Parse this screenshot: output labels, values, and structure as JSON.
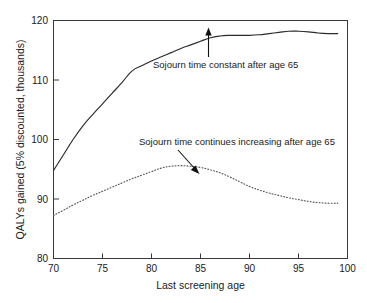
{
  "figure": {
    "background_color": "#ffffff",
    "ink_color": "#2b2b2b"
  },
  "chart_data": {
    "type": "line",
    "title": "",
    "xlabel": "Last screening age",
    "ylabel": "QALYs gained (5% discounted, thousands)",
    "xlim": [
      70,
      100
    ],
    "ylim": [
      80,
      120
    ],
    "xticks": [
      70,
      75,
      80,
      85,
      90,
      95,
      100
    ],
    "yticks": [
      80,
      90,
      100,
      110,
      120
    ],
    "xtick_labels": [
      "70",
      "75",
      "80",
      "85",
      "90",
      "95",
      "100"
    ],
    "ytick_labels": [
      "80",
      "90",
      "100",
      "110",
      "120"
    ],
    "grid": false,
    "legend": "none",
    "legend_position": "inline-annotations",
    "series": [
      {
        "name": "Sojourn time constant after age 65",
        "style": "solid",
        "color": "#2b2b2b",
        "x": [
          70,
          71,
          72,
          73,
          74,
          75,
          76,
          77,
          78,
          79,
          80,
          81,
          82,
          83,
          84,
          85,
          86,
          87,
          88,
          89,
          90,
          91,
          92,
          93,
          94,
          95,
          96,
          97,
          98,
          99
        ],
        "y": [
          94.8,
          97.4,
          100.0,
          102.3,
          104.2,
          106.0,
          107.8,
          109.6,
          111.5,
          112.4,
          113.2,
          113.9,
          114.6,
          115.3,
          115.9,
          116.5,
          117.1,
          117.4,
          117.5,
          117.5,
          117.5,
          117.6,
          117.8,
          118.0,
          118.2,
          118.2,
          118.1,
          117.9,
          117.8,
          117.8
        ]
      },
      {
        "name": "Sojourn time continues increasing after age 65",
        "style": "dotted",
        "color": "#5a5a5a",
        "x": [
          70,
          71,
          72,
          73,
          74,
          75,
          76,
          77,
          78,
          79,
          80,
          81,
          82,
          83,
          84,
          85,
          86,
          87,
          88,
          89,
          90,
          91,
          92,
          93,
          94,
          95,
          96,
          97,
          98,
          99
        ],
        "y": [
          87.2,
          88.1,
          89.0,
          89.8,
          90.6,
          91.3,
          92.0,
          92.7,
          93.4,
          94.0,
          94.6,
          95.2,
          95.5,
          95.6,
          95.5,
          95.3,
          94.9,
          94.4,
          93.7,
          92.9,
          92.1,
          91.5,
          91.0,
          90.6,
          90.2,
          89.9,
          89.6,
          89.4,
          89.3,
          89.3
        ]
      }
    ],
    "annotations": [
      {
        "text": "Sojourn time constant after age 65",
        "target_x": 85.6,
        "target_y": 117.2,
        "arrow_direction": "up"
      },
      {
        "text": "Sojourn time continues increasing after age 65",
        "target_x": 85.0,
        "target_y": 95.3,
        "arrow_direction": "down"
      }
    ]
  }
}
